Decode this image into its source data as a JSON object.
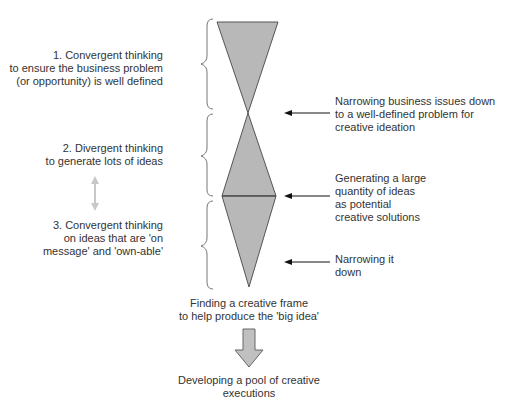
{
  "diagram": {
    "type": "creative-thinking-funnel",
    "colors": {
      "shape_fill": "#b8b8b8",
      "shape_stroke": "#555555",
      "arrow_black": "#111111",
      "double_arrow": "#c8c8c8",
      "big_arrow_fill": "#c0c0c0",
      "text": "#333333"
    },
    "left_labels": [
      {
        "text": "1. Convergent thinking\nto ensure the business problem\n(or opportunity) is well defined"
      },
      {
        "text": "2. Divergent thinking\nto generate lots of ideas"
      },
      {
        "text": "3. Convergent thinking\non ideas that are 'on\nmessage' and 'own-able'"
      }
    ],
    "right_labels": [
      {
        "text": "Narrowing business issues down\nto a well-defined problem for\ncreative ideation"
      },
      {
        "text": "Generating a large\nquantity of ideas\nas potential\ncreative solutions"
      },
      {
        "text": "Narrowing it\ndown"
      }
    ],
    "bottom": {
      "frame_label": "Finding a creative frame\nto help produce the 'big idea'",
      "result_label": "Developing a pool of creative\nexecutions"
    }
  }
}
